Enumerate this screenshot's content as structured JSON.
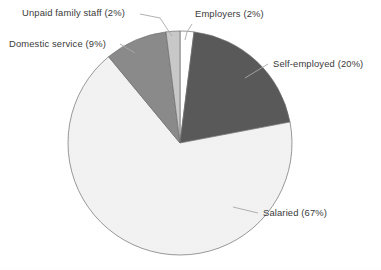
{
  "chart_data": {
    "type": "pie",
    "title": "",
    "subtitle": "",
    "xlabel": "",
    "ylabel": "",
    "legend_position": "none",
    "grid": false,
    "start_angle_deg": 0,
    "direction": "clockwise",
    "categories": [
      "Employers",
      "Self-employed",
      "Salaried",
      "Domestic service",
      "Unpaid family staff"
    ],
    "values": [
      2,
      20,
      67,
      9,
      2
    ],
    "value_unit": "%",
    "slices": [
      {
        "name": "Employers",
        "label": "Employers (2%)",
        "value": 2,
        "color": "#ffffff",
        "label_x": 195,
        "label_y": 17
      },
      {
        "name": "Self-employed",
        "label": "Self-employed (20%)",
        "value": 20,
        "color": "#595959",
        "label_x": 273,
        "label_y": 67
      },
      {
        "name": "Salaried",
        "label": "Salaried (67%)",
        "value": 67,
        "color": "#f2f2f2",
        "label_x": 263,
        "label_y": 216
      },
      {
        "name": "Domestic service",
        "label": "Domestic service (9%)",
        "value": 9,
        "color": "#8a8a8a",
        "label_x": 9,
        "label_y": 47
      },
      {
        "name": "Unpaid family staff",
        "label": "Unpaid family staff (2%)",
        "value": 2,
        "color": "#c8c8c8",
        "label_x": 22,
        "label_y": 16
      }
    ],
    "geometry": {
      "center_x": 180,
      "center_y": 143,
      "radius": 112
    },
    "colors": {
      "employers": "#ffffff",
      "self_employed": "#595959",
      "salaried": "#f2f2f2",
      "domestic_service": "#8a8a8a",
      "unpaid_family_staff": "#c8c8c8",
      "outline": "#6e6e6e",
      "leader_line": "#a8a8a8",
      "text": "#3a3a3a",
      "background": "#ffffff"
    }
  }
}
